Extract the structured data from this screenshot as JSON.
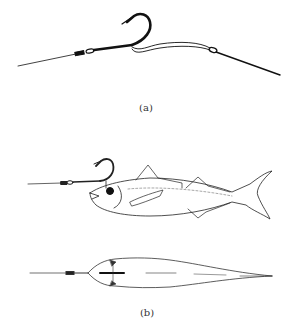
{
  "figure": {
    "panels": [
      {
        "id": "a",
        "label": "(a)",
        "description": "Hook rigged on leader with snelled wire loop"
      },
      {
        "id": "b",
        "label": "(b)",
        "description": "Hook rigged through bait fish, side and top views"
      }
    ],
    "colors": {
      "ink": "#111111",
      "background": "#ffffff",
      "caption": "#333333"
    }
  }
}
